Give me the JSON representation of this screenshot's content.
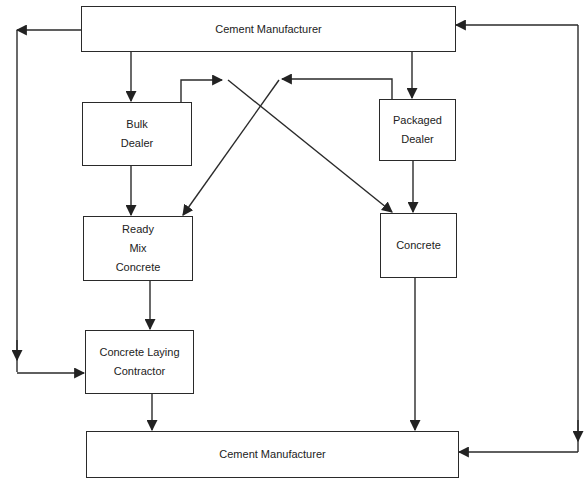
{
  "diagram": {
    "type": "flowchart",
    "nodes": [
      {
        "id": "cement_top",
        "lines": [
          "Cement Manufacturer"
        ]
      },
      {
        "id": "bulk_dealer",
        "lines": [
          "Bulk",
          "Dealer"
        ]
      },
      {
        "id": "packaged_dealer",
        "lines": [
          "Packaged Dealer"
        ]
      },
      {
        "id": "ready_mix",
        "lines": [
          "Ready",
          "Mix",
          "Concrete"
        ]
      },
      {
        "id": "concrete",
        "lines": [
          "Concrete"
        ]
      },
      {
        "id": "laying_contractor",
        "lines": [
          "Concrete Laying",
          "Contractor"
        ]
      },
      {
        "id": "cement_bottom",
        "lines": [
          "Cement Manufacturer"
        ]
      }
    ],
    "edges": [
      {
        "from": "cement_top",
        "to": "bulk_dealer"
      },
      {
        "from": "cement_top",
        "to": "packaged_dealer"
      },
      {
        "from": "cement_top",
        "to": "laying_contractor",
        "route": "left-loop"
      },
      {
        "from": "cement_bottom",
        "to": "cement_top",
        "route": "right-loop"
      },
      {
        "from": "bulk_dealer",
        "to": "ready_mix"
      },
      {
        "from": "bulk_dealer",
        "to": "concrete",
        "route": "crossing"
      },
      {
        "from": "packaged_dealer",
        "to": "ready_mix",
        "route": "crossing"
      },
      {
        "from": "packaged_dealer",
        "to": "concrete"
      },
      {
        "from": "ready_mix",
        "to": "laying_contractor"
      },
      {
        "from": "laying_contractor",
        "to": "cement_bottom"
      },
      {
        "from": "concrete",
        "to": "cement_bottom"
      },
      {
        "from": "cement_top",
        "to": "cement_bottom",
        "route": "right-loop"
      }
    ],
    "colors": {
      "line": "#2a2a2a",
      "box_fill": "#ffffff",
      "background": "#ffffff"
    }
  }
}
